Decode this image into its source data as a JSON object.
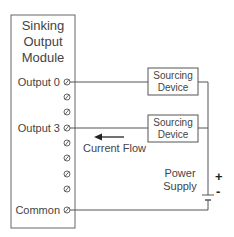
{
  "module": {
    "title_lines": [
      "Sinking",
      "Output",
      "Module"
    ],
    "terminals": [
      {
        "label": "Output 0",
        "y": 82
      },
      {
        "label": "",
        "y": 97
      },
      {
        "label": "",
        "y": 112
      },
      {
        "label": "Output 3",
        "y": 128
      },
      {
        "label": "",
        "y": 143
      },
      {
        "label": "",
        "y": 158
      },
      {
        "label": "",
        "y": 174
      },
      {
        "label": "",
        "y": 189
      },
      {
        "label": "Common",
        "y": 210
      }
    ]
  },
  "devices": [
    {
      "line1": "Sourcing",
      "line2": "Device"
    },
    {
      "line1": "Sourcing",
      "line2": "Device"
    }
  ],
  "current_flow_label": "Current Flow",
  "power_supply": {
    "line1": "Power",
    "line2": "Supply",
    "plus": "+",
    "minus": "-"
  },
  "colors": {
    "line": "#555555",
    "text": "#444444"
  }
}
